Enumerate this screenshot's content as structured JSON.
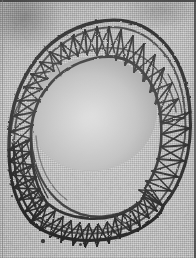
{
  "image": {
    "title": "Woven lattice ring basket",
    "medium": "halftone photographic plate scan",
    "subject": "open cylindrical wicker / wire basket seen obliquely from above",
    "caption": "",
    "alt_text": "A coarse black-and-white halftone photograph of a circular open-topped basket woven as a triangular lattice, tilted so the near rim sweeps across the bottom and the interior cavity is visible."
  },
  "canvas": {
    "width": 196,
    "height": 258,
    "background_color": "#c9c9c9",
    "ink_color": "#1d1d1d",
    "paper_tone": "#cccccc",
    "interior_tone": "#bdbdbd"
  },
  "borders": {
    "top_rule": true,
    "right_rule": true,
    "left_rule": true,
    "bottom_rule": false,
    "rule_color": "#3a3a3a"
  },
  "artifacts": {
    "specks": [
      {
        "x": 43,
        "y": 241,
        "r": 1.6
      },
      {
        "x": 80,
        "y": 244,
        "r": 1.5
      },
      {
        "x": 118,
        "y": 238,
        "r": 1.2
      },
      {
        "x": 12,
        "y": 196,
        "r": 1.1
      },
      {
        "x": 168,
        "y": 120,
        "r": 1.0
      }
    ],
    "smudge_top_left": true,
    "smudge_top_right": true
  },
  "structure": {
    "form": "torus-like open ring",
    "weave": "triangular zig-zag lattice between parallel hoops",
    "outer_ellipse": {
      "cx": 96,
      "cy": 131,
      "rx": 92,
      "ry": 118,
      "rotation_deg": -4
    },
    "mouth_ellipse": {
      "cx": 93,
      "cy": 112,
      "rx": 63,
      "ry": 56,
      "rotation_deg": -10
    },
    "hoop_count": 3,
    "rib_count": 34,
    "stroke_widths": {
      "rim": 3.0,
      "hoop": 2.0,
      "rib": 1.8,
      "diagonal": 1.5
    },
    "dense_region": "left side, where the band is seen edge-on"
  }
}
